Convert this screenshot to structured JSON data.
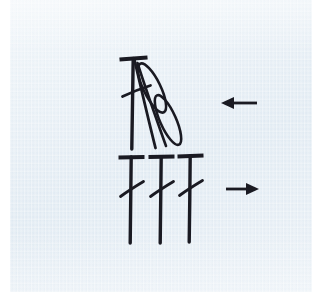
{
  "canvas": {
    "width": 312,
    "height": 308,
    "background": "#ffffff",
    "panel_background": "#e2ecf4",
    "ink_color": "#1a1a22"
  },
  "figure": {
    "kind": "hand-drawn-music-notation",
    "description": "Two groups of note stems with diagonal slash flags and two directional arrows",
    "panel": {
      "x": 10,
      "y": 0,
      "width": 302,
      "height": 292
    }
  },
  "groups": [
    {
      "id": "upper-group",
      "label": "upper-note-group",
      "arrow_direction": "left",
      "beam": {
        "x1": 120,
        "y1": 59,
        "x2": 147,
        "y2": 57,
        "width": 3.4
      },
      "stems": [
        {
          "id": "upper-stem-1",
          "x1": 133,
          "y1": 58,
          "x2": 132,
          "y2": 149,
          "width": 3.2
        }
      ],
      "diagonals": [
        {
          "id": "upper-diagonal-a",
          "x1": 134,
          "y1": 60,
          "x2": 155,
          "y2": 148,
          "width": 2.6
        },
        {
          "id": "upper-diagonal-b",
          "x1": 136,
          "y1": 62,
          "x2": 166,
          "y2": 146,
          "width": 2.4
        }
      ],
      "slashes": [
        {
          "id": "upper-slash-1",
          "x1": 123,
          "y1": 96,
          "x2": 150,
          "y2": 86,
          "width": 2.6
        }
      ],
      "loops": [
        {
          "id": "grace-loop-1",
          "cx": 152,
          "cy": 88,
          "rx": 27,
          "ry": 8.5,
          "rotation": 64,
          "width": 2.4
        },
        {
          "id": "grace-loop-2",
          "cx": 168,
          "cy": 120,
          "rx": 27,
          "ry": 8.0,
          "rotation": 66,
          "width": 2.4
        }
      ]
    },
    {
      "id": "lower-group",
      "label": "lower-note-group",
      "arrow_direction": "right",
      "beams": [
        {
          "id": "lower-beam-1",
          "x1": 119,
          "y1": 157,
          "x2": 144,
          "y2": 157,
          "width": 3.4
        },
        {
          "id": "lower-beam-2",
          "x1": 149,
          "y1": 157,
          "x2": 174,
          "y2": 156,
          "width": 3.4
        },
        {
          "id": "lower-beam-3",
          "x1": 178,
          "y1": 156,
          "x2": 203,
          "y2": 155,
          "width": 3.4
        }
      ],
      "stems": [
        {
          "id": "lower-stem-1",
          "x1": 131,
          "y1": 157,
          "x2": 130,
          "y2": 243,
          "width": 3.2
        },
        {
          "id": "lower-stem-2",
          "x1": 161,
          "y1": 157,
          "x2": 160,
          "y2": 243,
          "width": 3.2
        },
        {
          "id": "lower-stem-3",
          "x1": 190,
          "y1": 156,
          "x2": 189,
          "y2": 243,
          "width": 3.2
        }
      ],
      "slashes": [
        {
          "id": "lower-slash-1",
          "x1": 121,
          "y1": 196,
          "x2": 143,
          "y2": 182,
          "width": 2.6
        },
        {
          "id": "lower-slash-2",
          "x1": 151,
          "y1": 196,
          "x2": 173,
          "y2": 182,
          "width": 2.6
        },
        {
          "id": "lower-slash-3",
          "x1": 180,
          "y1": 195,
          "x2": 202,
          "y2": 181,
          "width": 2.6
        }
      ]
    }
  ],
  "arrows": [
    {
      "id": "arrow-left",
      "direction": "left",
      "symbol": "←",
      "shaft": {
        "x1": 228,
        "y1": 103,
        "x2": 256,
        "y2": 103
      },
      "head": {
        "tip_x": 222,
        "tip_y": 103,
        "back_x": 234,
        "half_height": 6
      },
      "width": 2.6
    },
    {
      "id": "arrow-right",
      "direction": "right",
      "symbol": "→",
      "shaft": {
        "x1": 228,
        "y1": 189,
        "x2": 252,
        "y2": 189
      },
      "head": {
        "tip_x": 258,
        "tip_y": 189,
        "back_x": 246,
        "half_height": 6
      },
      "width": 2.6
    }
  ]
}
